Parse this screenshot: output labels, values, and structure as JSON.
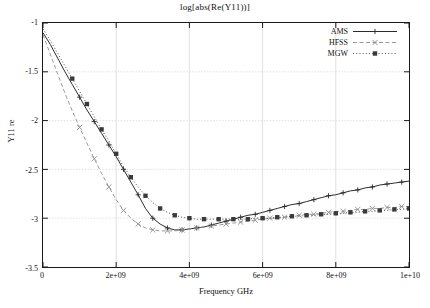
{
  "chart_data": {
    "type": "line",
    "title": "log[abs(Re(Y11))]",
    "xlabel": "Frequency GHz",
    "ylabel": "Y11 re",
    "xlim": [
      0,
      10000000000
    ],
    "ylim": [
      -3.5,
      -1
    ],
    "grid": true,
    "legend_position": "top-right",
    "xticks": [
      {
        "value": 0,
        "label": "0"
      },
      {
        "value": 2000000000,
        "label": "2e+09"
      },
      {
        "value": 4000000000,
        "label": "4e+09"
      },
      {
        "value": 6000000000,
        "label": "6e+09"
      },
      {
        "value": 8000000000,
        "label": "8e+09"
      },
      {
        "value": 10000000000,
        "label": "1e+10"
      }
    ],
    "yticks": [
      {
        "value": -1,
        "label": "-1"
      },
      {
        "value": -1.5,
        "label": "-1.5"
      },
      {
        "value": -2,
        "label": "-2"
      },
      {
        "value": -2.5,
        "label": "-2.5"
      },
      {
        "value": -3,
        "label": "-3"
      },
      {
        "value": -3.5,
        "label": "-3.5"
      }
    ],
    "x": [
      0,
      200000000,
      400000000,
      600000000,
      800000000,
      1000000000,
      1200000000,
      1400000000,
      1600000000,
      1800000000,
      2000000000,
      2200000000,
      2400000000,
      2600000000,
      2800000000,
      3000000000,
      3200000000,
      3400000000,
      3600000000,
      3800000000,
      4000000000,
      4200000000,
      4400000000,
      4600000000,
      4800000000,
      5000000000,
      5200000000,
      5400000000,
      5600000000,
      5800000000,
      6000000000,
      6200000000,
      6400000000,
      6600000000,
      6800000000,
      7000000000,
      7200000000,
      7400000000,
      7600000000,
      7800000000,
      8000000000,
      8200000000,
      8400000000,
      8600000000,
      8800000000,
      9000000000,
      9200000000,
      9400000000,
      9600000000,
      9800000000,
      10000000000
    ],
    "series": [
      {
        "name": "AMS",
        "line_style": "solid",
        "marker": "plus",
        "color": "#2b2b2b",
        "values": [
          -1.1,
          -1.22,
          -1.36,
          -1.5,
          -1.63,
          -1.76,
          -1.89,
          -2.01,
          -2.13,
          -2.25,
          -2.37,
          -2.5,
          -2.63,
          -2.76,
          -2.9,
          -3.0,
          -3.06,
          -3.1,
          -3.12,
          -3.12,
          -3.11,
          -3.1,
          -3.09,
          -3.07,
          -3.05,
          -3.03,
          -3.01,
          -2.99,
          -2.97,
          -2.96,
          -2.94,
          -2.92,
          -2.9,
          -2.88,
          -2.86,
          -2.85,
          -2.83,
          -2.81,
          -2.79,
          -2.77,
          -2.76,
          -2.74,
          -2.72,
          -2.71,
          -2.69,
          -2.68,
          -2.66,
          -2.65,
          -2.64,
          -2.63,
          -2.62
        ]
      },
      {
        "name": "HFSS",
        "line_style": "dashed",
        "marker": "cross",
        "color": "#8c8c8c",
        "values": [
          -1.12,
          -1.32,
          -1.52,
          -1.72,
          -1.9,
          -2.07,
          -2.23,
          -2.39,
          -2.54,
          -2.68,
          -2.81,
          -2.92,
          -3.0,
          -3.06,
          -3.1,
          -3.12,
          -3.13,
          -3.13,
          -3.13,
          -3.12,
          -3.11,
          -3.1,
          -3.09,
          -3.08,
          -3.07,
          -3.06,
          -3.05,
          -3.04,
          -3.03,
          -3.02,
          -3.01,
          -3.0,
          -3.0,
          -2.99,
          -2.98,
          -2.97,
          -2.96,
          -2.96,
          -2.95,
          -2.94,
          -2.93,
          -2.93,
          -2.92,
          -2.91,
          -2.91,
          -2.9,
          -2.9,
          -2.89,
          -2.89,
          -2.88,
          -2.88
        ]
      },
      {
        "name": "MGW",
        "line_style": "dotted",
        "marker": "square",
        "color": "#3a3a3a",
        "values": [
          -1.06,
          -1.18,
          -1.31,
          -1.44,
          -1.57,
          -1.7,
          -1.83,
          -1.96,
          -2.09,
          -2.21,
          -2.34,
          -2.47,
          -2.58,
          -2.68,
          -2.77,
          -2.84,
          -2.9,
          -2.94,
          -2.97,
          -2.99,
          -3.0,
          -3.01,
          -3.01,
          -3.01,
          -3.01,
          -3.01,
          -3.01,
          -3.01,
          -3.01,
          -3.0,
          -3.0,
          -3.0,
          -2.99,
          -2.99,
          -2.98,
          -2.98,
          -2.97,
          -2.97,
          -2.96,
          -2.96,
          -2.95,
          -2.95,
          -2.94,
          -2.94,
          -2.93,
          -2.93,
          -2.92,
          -2.92,
          -2.91,
          -2.91,
          -2.9
        ]
      }
    ]
  },
  "legend": {
    "items": [
      {
        "label": "AMS"
      },
      {
        "label": "HFSS"
      },
      {
        "label": "MGW"
      }
    ]
  },
  "style": {
    "grid_color": "#d9d9d9",
    "frame_color": "#1a1a1a",
    "background": "#ffffff"
  }
}
